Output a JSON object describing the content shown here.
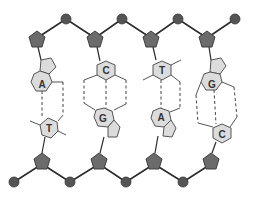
{
  "diagram": {
    "title": "",
    "colors": {
      "background": "#ffffff",
      "sugar": "#6b6b6b",
      "phosphate": "#555555",
      "base_ring": "#dcdcdc",
      "line": "#2a2a2a"
    },
    "pairs": [
      {
        "top_base": "A",
        "bottom_base": "T"
      },
      {
        "top_base": "C",
        "bottom_base": "G"
      },
      {
        "top_base": "T",
        "bottom_base": "A"
      },
      {
        "top_base": "G",
        "bottom_base": "C"
      }
    ]
  }
}
